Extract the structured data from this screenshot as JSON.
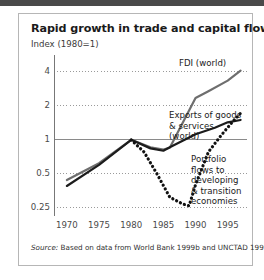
{
  "figure": {
    "title": "Rapid growth in trade and capital flows",
    "subtitle": "Index (1980=1)",
    "source_label": "Source:",
    "source_text": " Based on data from World Bank 1999b and UNCTAD 1999."
  },
  "colors": {
    "fdi_line": "#6e6e6e",
    "exports_line": "#1c1c1c",
    "portfolio_line": "#111111",
    "gridline": "#9a9a9a",
    "baseline": "#8a8a8a",
    "axis": "#777777",
    "frame": "#b6b6b6",
    "top_band": "#4a4a4a",
    "text": "#1a1a1a"
  },
  "chart_data": {
    "type": "line",
    "title": "Rapid growth in trade and capital flows",
    "subtitle": "Index (1980=1)",
    "xlabel": "",
    "ylabel": "Index (1980=1)",
    "yscale": "log",
    "ylim": [
      0.22,
      5.0
    ],
    "xlim": [
      1968,
      1998
    ],
    "grid": true,
    "legend_position": "inline-annotations",
    "ytick_labels": [
      "4",
      "2",
      "1",
      "0.5",
      "0.25"
    ],
    "ytick_values": [
      4,
      2,
      1,
      0.5,
      0.25
    ],
    "xtick_labels": [
      "1970",
      "1975",
      "1980",
      "1985",
      "1990",
      "1995"
    ],
    "xtick_values": [
      1970,
      1975,
      1980,
      1985,
      1990,
      1995
    ],
    "series": [
      {
        "name": "FDI (world)",
        "style": "solid",
        "color": "#6e6e6e",
        "x": [
          1970,
          1975,
          1980,
          1983,
          1985,
          1986,
          1990,
          1992,
          1995,
          1997
        ],
        "y": [
          0.44,
          0.62,
          1.0,
          0.86,
          0.82,
          0.85,
          2.35,
          2.7,
          3.35,
          4.1
        ]
      },
      {
        "name": "Exports of goods & services (world)",
        "style": "solid",
        "color": "#1c1c1c",
        "x": [
          1970,
          1975,
          1980,
          1983,
          1985,
          1986,
          1990,
          1993,
          1995,
          1997
        ],
        "y": [
          0.39,
          0.6,
          1.0,
          0.84,
          0.8,
          0.86,
          1.12,
          1.28,
          1.43,
          1.5
        ]
      },
      {
        "name": "Portfolio flows to developing & transition economies",
        "style": "dotted",
        "color": "#111111",
        "x": [
          1980,
          1982,
          1984,
          1986,
          1988,
          1989,
          1990,
          1992,
          1994,
          1996,
          1997
        ],
        "y": [
          1.0,
          0.78,
          0.5,
          0.31,
          0.27,
          0.26,
          0.4,
          0.78,
          1.1,
          1.5,
          1.72
        ]
      }
    ],
    "annotations": [
      {
        "text": "FDI (world)",
        "series": "FDI (world)"
      },
      {
        "text": "Exports of goods\n& services\n(world)",
        "series": "Exports of goods & services (world)"
      },
      {
        "text": "Portfolio\nflows to\ndeveloping\n& transition\neconomies",
        "series": "Portfolio flows to developing & transition economies"
      }
    ]
  }
}
